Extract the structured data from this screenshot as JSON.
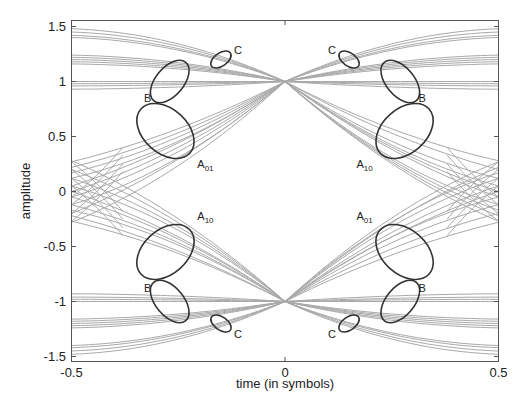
{
  "chart_data": {
    "type": "line",
    "title": "",
    "subtitle": "",
    "xlabel": "time (in symbols)",
    "ylabel": "amplitude",
    "xlim": [
      -0.5,
      0.5
    ],
    "ylim": [
      -1.55,
      1.55
    ],
    "grid": false,
    "legend": "none",
    "x_ticks": [
      -0.5,
      0,
      0.5
    ],
    "x_tick_labels": [
      "-0.5",
      "0",
      "0.5"
    ],
    "y_ticks": [
      -1.5,
      -1,
      -0.5,
      0,
      0.5,
      1,
      1.5
    ],
    "y_tick_labels": [
      "-1.5",
      "-1",
      "-0.5",
      "0",
      "0.5",
      "1",
      "1.5"
    ],
    "trace_color": "#a9a9a9",
    "ellipse_color": "#333333",
    "series": [
      {
        "name": "upper-flat",
        "start_levels_left": [
          1.48,
          1.45,
          1.42,
          1.4
        ],
        "end": 1.0,
        "note": "outer traces near 1.5 at edges"
      },
      {
        "name": "upper-mid",
        "start_levels_left": [
          1.24,
          1.22,
          1.2,
          1.18,
          1.16
        ],
        "end": 1.0
      },
      {
        "name": "upper-near",
        "start_levels_left": [
          1.0,
          0.98,
          0.96,
          0.93
        ],
        "end": 1.0
      },
      {
        "name": "rising",
        "start_levels_left": [
          0.27,
          0.22,
          0.17,
          0.12,
          0.05,
          0.0,
          -0.05,
          -0.12,
          -0.2,
          -0.28
        ],
        "end": 1.0
      },
      {
        "name": "falling",
        "start_levels_left": [
          0.28,
          0.2,
          0.12,
          0.05,
          0.0,
          -0.05,
          -0.12,
          -0.17,
          -0.22,
          -0.27
        ],
        "end": -1.0
      },
      {
        "name": "lower-near",
        "start_levels_left": [
          -0.93,
          -0.96,
          -0.98,
          -1.0
        ],
        "end": -1.0
      },
      {
        "name": "lower-mid",
        "start_levels_left": [
          -1.16,
          -1.18,
          -1.2,
          -1.22,
          -1.24
        ],
        "end": -1.0
      },
      {
        "name": "lower-flat",
        "start_levels_left": [
          -1.4,
          -1.42,
          -1.45,
          -1.48
        ],
        "end": -1.0
      }
    ],
    "annotations": [
      {
        "label": "C",
        "sub": "",
        "t": -0.15,
        "a": 1.2,
        "region": "upper-left"
      },
      {
        "label": "B",
        "sub": "",
        "t": -0.27,
        "a": 1.0,
        "region": "upper-left"
      },
      {
        "label": "A",
        "sub": "01",
        "t": -0.28,
        "a": 0.55,
        "region": "upper-left"
      },
      {
        "label": "C",
        "sub": "",
        "t": 0.15,
        "a": 1.2,
        "region": "upper-right"
      },
      {
        "label": "B",
        "sub": "",
        "t": 0.27,
        "a": 1.0,
        "region": "upper-right"
      },
      {
        "label": "A",
        "sub": "10",
        "t": 0.28,
        "a": 0.55,
        "region": "upper-right"
      },
      {
        "label": "A",
        "sub": "10",
        "t": -0.28,
        "a": -0.55,
        "region": "lower-left"
      },
      {
        "label": "B",
        "sub": "",
        "t": -0.27,
        "a": -1.0,
        "region": "lower-left"
      },
      {
        "label": "C",
        "sub": "",
        "t": -0.15,
        "a": -1.2,
        "region": "lower-left"
      },
      {
        "label": "A",
        "sub": "01",
        "t": 0.28,
        "a": -0.55,
        "region": "lower-right"
      },
      {
        "label": "B",
        "sub": "",
        "t": 0.27,
        "a": -1.0,
        "region": "lower-right"
      },
      {
        "label": "C",
        "sub": "",
        "t": 0.15,
        "a": -1.2,
        "region": "lower-right"
      }
    ]
  }
}
